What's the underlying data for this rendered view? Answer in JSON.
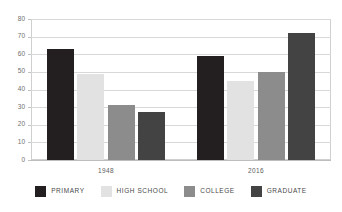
{
  "chart_data": {
    "type": "bar",
    "title": "",
    "subtitle": "",
    "xlabel": "",
    "ylabel": "",
    "categories": [
      "1948",
      "2016"
    ],
    "series": [
      {
        "name": "PRIMARY",
        "color": "#231f20",
        "values": [
          63,
          59
        ]
      },
      {
        "name": "HIGH SCHOOL",
        "color": "#e2e2e2",
        "values": [
          49,
          45
        ]
      },
      {
        "name": "COLLEGE",
        "color": "#8c8c8c",
        "values": [
          31,
          50
        ]
      },
      {
        "name": "GRADUATE",
        "color": "#434343",
        "values": [
          27,
          72
        ]
      }
    ],
    "ylim": [
      0,
      80
    ],
    "yticks": [
      0,
      10,
      20,
      30,
      40,
      50,
      60,
      70,
      80
    ],
    "ytick_labels": [
      "0",
      "10",
      "20",
      "30",
      "40",
      "50",
      "60",
      "70",
      "80"
    ],
    "grid": true,
    "grid_axis": "y",
    "legend_position": "bottom",
    "legend_entries": [
      "PRIMARY",
      "HIGH SCHOOL",
      "COLLEGE",
      "GRADUATE"
    ],
    "background_color": "#ffffff",
    "grid_color": "#d8d8d8",
    "axis_color": "#cfcfcf",
    "tick_label_color": "#6f6f6f"
  }
}
